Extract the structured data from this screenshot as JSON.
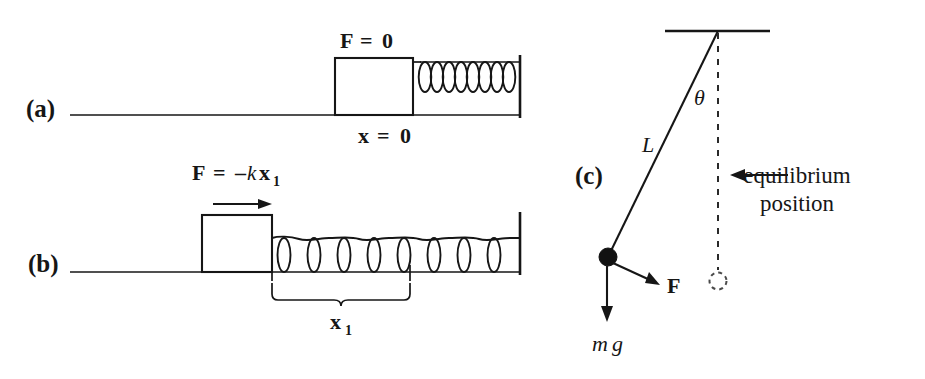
{
  "figure": {
    "ink_color": "#161616",
    "background_color": "#ffffff"
  },
  "panels": [
    {
      "id": "a",
      "tag": "(a)",
      "description": "Block at rest against relaxed spring, no net force",
      "labels": {
        "force": {
          "symbol": "F",
          "relation": "=",
          "value": "0"
        },
        "position": {
          "symbol": "x",
          "relation": "=",
          "value": "0"
        }
      },
      "spring": {
        "coils": 8,
        "state": "relaxed"
      }
    },
    {
      "id": "b",
      "tag": "(b)",
      "description": "Block displaced, spring stretched, restoring force",
      "labels": {
        "force": {
          "symbol": "F",
          "relation": "=",
          "minus": "–",
          "k": "k",
          "x": "x",
          "sub": "1"
        },
        "displacement": {
          "symbol": "x",
          "sub": "1"
        }
      },
      "spring": {
        "coils": 8,
        "state": "stretched"
      },
      "arrow_direction": "right"
    },
    {
      "id": "c",
      "tag": "(c)",
      "description": "Simple pendulum displaced from equilibrium",
      "labels": {
        "angle": "θ",
        "length": "L",
        "force": "F",
        "weight_m": "m",
        "weight_g": "g",
        "equilibrium_line1": "equilibrium",
        "equilibrium_line2": "position"
      }
    }
  ]
}
